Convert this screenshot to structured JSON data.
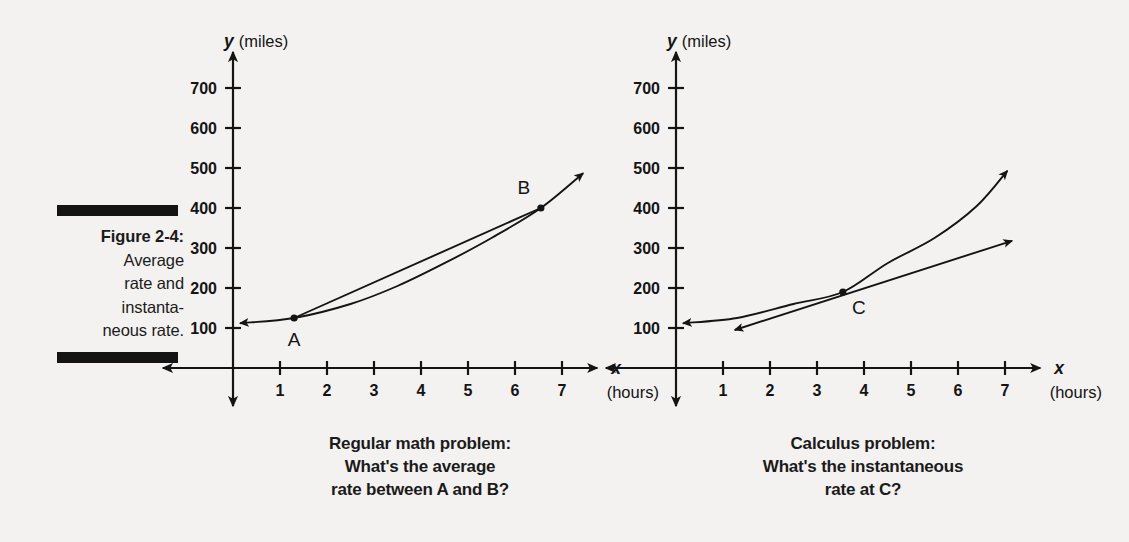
{
  "figure": {
    "label": "Figure 2-4:",
    "lines": [
      "Average",
      "rate and",
      "instanta-",
      "neous rate."
    ]
  },
  "charts": [
    {
      "id": "left",
      "caption": [
        "Regular math problem:",
        "What's the average",
        "rate between A and B?"
      ],
      "chart_data": {
        "type": "line",
        "title": "Regular math problem: What's the average rate between A and B?",
        "xlabel": "x",
        "xunits": "(hours)",
        "ylabel": "y",
        "yunits": "(miles)",
        "xticks": [
          1,
          2,
          3,
          4,
          5,
          6,
          7
        ],
        "yticks": [
          100,
          200,
          300,
          400,
          500,
          600,
          700
        ],
        "xlim": [
          0,
          7.6
        ],
        "ylim": [
          0,
          760
        ],
        "grid": false,
        "legend": "none",
        "series": [
          {
            "name": "distance curve",
            "kind": "curve",
            "arrow_start": true,
            "arrow_end": true,
            "points": [
              {
                "x": 0.15,
                "y": 112
              },
              {
                "x": 1.3,
                "y": 125
              },
              {
                "x": 2.5,
                "y": 160
              },
              {
                "x": 3.5,
                "y": 205
              },
              {
                "x": 4.5,
                "y": 262
              },
              {
                "x": 5.5,
                "y": 325
              },
              {
                "x": 6.55,
                "y": 400
              },
              {
                "x": 7.45,
                "y": 487
              }
            ]
          },
          {
            "name": "secant line A to B",
            "kind": "segment",
            "arrow_start": false,
            "arrow_end": false,
            "points": [
              {
                "x": 1.3,
                "y": 125
              },
              {
                "x": 6.55,
                "y": 400
              }
            ]
          }
        ],
        "annotations": [
          {
            "label": "A",
            "x": 1.3,
            "y": 125,
            "marker": true,
            "label_pos": "below"
          },
          {
            "label": "B",
            "x": 6.55,
            "y": 400,
            "marker": true,
            "label_pos": "above-left"
          }
        ]
      }
    },
    {
      "id": "right",
      "caption": [
        "Calculus problem:",
        "What's the instantaneous",
        "rate at C?"
      ],
      "chart_data": {
        "type": "line",
        "title": "Calculus problem: What's the instantaneous rate at C?",
        "xlabel": "x",
        "xunits": "(hours)",
        "ylabel": "y",
        "yunits": "(miles)",
        "xticks": [
          1,
          2,
          3,
          4,
          5,
          6,
          7
        ],
        "yticks": [
          100,
          200,
          300,
          400,
          500,
          600,
          700
        ],
        "xlim": [
          0,
          7.6
        ],
        "ylim": [
          0,
          760
        ],
        "grid": false,
        "legend": "none",
        "series": [
          {
            "name": "distance curve",
            "kind": "curve",
            "arrow_start": true,
            "arrow_end": true,
            "points": [
              {
                "x": 0.15,
                "y": 112
              },
              {
                "x": 1.3,
                "y": 125
              },
              {
                "x": 2.5,
                "y": 160
              },
              {
                "x": 3.55,
                "y": 190
              },
              {
                "x": 4.5,
                "y": 262
              },
              {
                "x": 5.5,
                "y": 325
              },
              {
                "x": 6.4,
                "y": 405
              },
              {
                "x": 7.05,
                "y": 493
              }
            ]
          },
          {
            "name": "tangent line at C",
            "kind": "segment",
            "arrow_start": true,
            "arrow_end": true,
            "points": [
              {
                "x": 1.25,
                "y": 95
              },
              {
                "x": 7.15,
                "y": 318
              }
            ]
          }
        ],
        "annotations": [
          {
            "label": "C",
            "x": 3.55,
            "y": 190,
            "marker": true,
            "label_pos": "below-right"
          }
        ]
      }
    }
  ]
}
